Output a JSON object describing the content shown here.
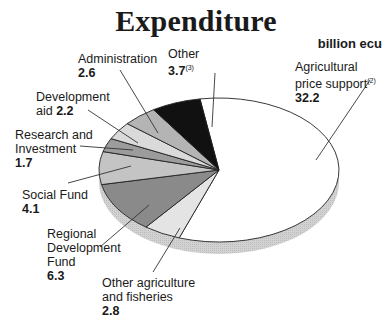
{
  "chart_data": {
    "type": "pie",
    "title": "Expenditure",
    "unit": "billion ecu",
    "slices": [
      {
        "label": "Agricultural price support",
        "note": "(2)",
        "value": 32.2,
        "fill": "#ffffff"
      },
      {
        "label": "Other agriculture and fisheries",
        "note": "",
        "value": 2.8,
        "fill": "#e4e4e4"
      },
      {
        "label": "Regional Development Fund",
        "note": "",
        "value": 6.3,
        "fill": "#8a8a8a"
      },
      {
        "label": "Social Fund",
        "note": "",
        "value": 4.1,
        "fill": "#c4c4c4"
      },
      {
        "label": "Research and Investment",
        "note": "",
        "value": 1.7,
        "fill": "#9c9c9c"
      },
      {
        "label": "Development aid",
        "note": "",
        "value": 2.2,
        "fill": "#dadada"
      },
      {
        "label": "Administration",
        "note": "",
        "value": 2.6,
        "fill": "#b4b4b4"
      },
      {
        "label": "Other",
        "note": "(3)",
        "value": 3.7,
        "fill": "#111111"
      }
    ]
  },
  "labels": {
    "title": "Expenditure",
    "unit": "billion ecu",
    "agri_1": "Agricultural",
    "agri_2": "price support",
    "agri_note": "(2)",
    "agri_value": "32.2",
    "other_1": "Other",
    "other_value": "3.7",
    "other_note": "(3)",
    "admin_1": "Administration",
    "admin_value": "2.6",
    "dev_1": "Development",
    "dev_2": "aid",
    "dev_value": "2.2",
    "research_1": "Research and",
    "research_2": "Investment",
    "research_value": "1.7",
    "social_1": "Social Fund",
    "social_value": "4.1",
    "regional_1": "Regional",
    "regional_2": "Development",
    "regional_3": "Fund",
    "regional_value": "6.3",
    "otheragri_1": "Other agriculture",
    "otheragri_2": "and fisheries",
    "otheragri_value": "2.8"
  }
}
